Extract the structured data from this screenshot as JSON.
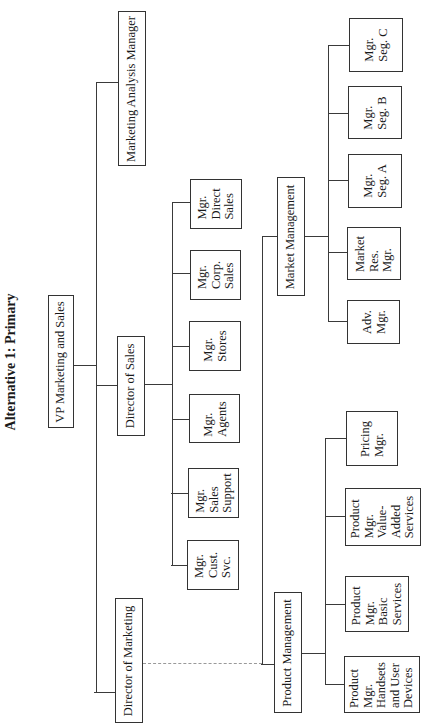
{
  "title": "Alternative 1: Primary",
  "nodes": {
    "vp": "VP Marketing and Sales",
    "marketing_analysis": "Marketing Analysis Manager",
    "director_sales": "Director of Sales",
    "director_marketing": "Director of Marketing",
    "mgr_direct_sales": "Mgr.\nDirect\nSales",
    "mgr_corp_sales": "Mgr.\nCorp.\nSales",
    "mgr_stores": "Mgr.\nStores",
    "mgr_agents": "Mgr.\nAgents",
    "mgr_sales_support": "Mgr.\nSales\nSupport",
    "mgr_cust_svc": "Mgr.\nCust.\nSvc.",
    "market_management": "Market Management",
    "product_management": "Product Management",
    "mgr_seg_c": "Mgr.\nSeg. C",
    "mgr_seg_b": "Mgr.\nSeg. B",
    "mgr_seg_a": "Mgr.\nSeg. A",
    "market_res_mgr": "Market\nRes.\nMgr.",
    "adv_mgr": "Adv.\nMgr.",
    "pricing_mgr": "Pricing\nMgr.",
    "pm_value_added": "Product\nMgr.\nValue-\nAdded\nServices",
    "pm_basic": "Product\nMgr.\nBasic\nServices",
    "pm_handsets": "Product\nMgr.\nHandsets\nand User\nDevices"
  },
  "hierarchy": {
    "VP Marketing and Sales": [
      "Marketing Analysis Manager",
      "Director of Sales",
      "Director of Marketing"
    ],
    "Director of Sales": [
      "Mgr. Direct Sales",
      "Mgr. Corp. Sales",
      "Mgr. Stores",
      "Mgr. Agents",
      "Mgr. Sales Support",
      "Mgr. Cust. Svc."
    ],
    "Director of Marketing": [
      "Market Management",
      "Product Management"
    ],
    "Market Management": [
      "Mgr. Seg. C",
      "Mgr. Seg. B",
      "Mgr. Seg. A",
      "Market Res. Mgr.",
      "Adv. Mgr."
    ],
    "Product Management": [
      "Pricing Mgr.",
      "Product Mgr. Value-Added Services",
      "Product Mgr. Basic Services",
      "Product Mgr. Handsets and User Devices"
    ]
  }
}
